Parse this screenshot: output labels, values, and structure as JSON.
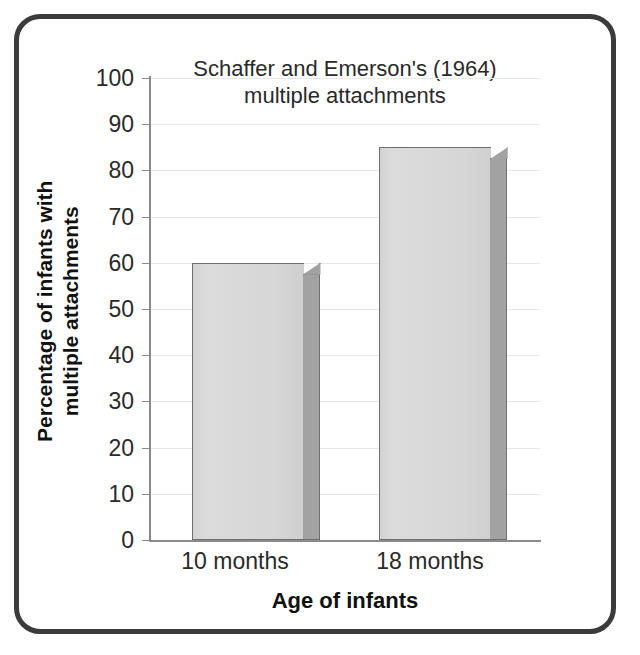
{
  "chart_data": {
    "type": "bar",
    "title": "Schaffer and Emerson's (1964) multiple attachments",
    "title_line1": "Schaffer and Emerson's (1964)",
    "title_line2": "multiple attachments",
    "categories": [
      "10 months",
      "18 months"
    ],
    "values": [
      60,
      85
    ],
    "xlabel": "Age of infants",
    "ylabel": "Percentage of infants with multiple attachments",
    "ylabel_line1": "Percentage of infants with",
    "ylabel_line2": "multiple attachments",
    "ylim": [
      0,
      100
    ],
    "ytick_labels": [
      "100",
      "90",
      "80",
      "70",
      "60",
      "50",
      "40",
      "30",
      "20",
      "10",
      "0"
    ],
    "ytick_values": [
      100,
      90,
      80,
      70,
      60,
      50,
      40,
      30,
      20,
      10,
      0
    ],
    "grid": true,
    "legend": null,
    "series": [
      {
        "name": "Percentage of infants with multiple attachments",
        "values": [
          60,
          85
        ]
      }
    ],
    "colors": {
      "bar_front": "#d6d6d6",
      "bar_side": "#a2a2a2",
      "bar_outline": "#6f6f6f",
      "axis": "#8a8a8a",
      "gridline": "#e8e8e8",
      "frame": "#3b3b3b",
      "text": "#2a2a2a",
      "background": "#ffffff"
    }
  }
}
